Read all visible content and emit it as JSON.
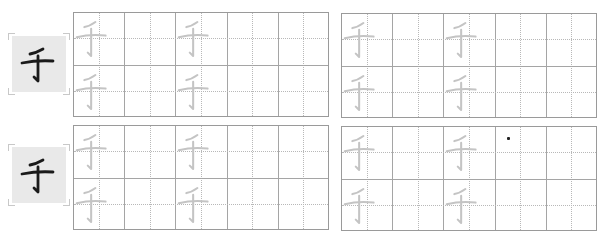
{
  "worksheet": {
    "character": "千",
    "stroke_description": "slant, horizontal, vertical-hook",
    "colors": {
      "model_ink": "#1a1a1a",
      "trace_ink": "#c4c4c4",
      "model_bg": "#e9e9e9",
      "grid_solid": "#a5a5a5",
      "grid_dotted": "#b8b8b8"
    },
    "rows": [
      {
        "model_char": "千",
        "panels": [
          {
            "columns": 5,
            "rows": 2,
            "trace_columns": [
              1,
              3
            ]
          },
          {
            "columns": 5,
            "rows": 2,
            "trace_columns": [
              1,
              3
            ]
          }
        ]
      },
      {
        "model_char": "千",
        "panels": [
          {
            "columns": 5,
            "rows": 2,
            "trace_columns": [
              1,
              3
            ]
          },
          {
            "columns": 5,
            "rows": 2,
            "trace_columns": [
              1,
              3
            ]
          }
        ]
      }
    ]
  }
}
